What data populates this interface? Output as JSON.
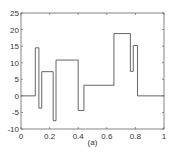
{
  "chart_data": {
    "type": "line",
    "subtype": "step",
    "title": "",
    "caption": "(a)",
    "xlabel": "",
    "ylabel": "",
    "xlim": [
      0,
      1
    ],
    "ylim": [
      -10,
      25
    ],
    "grid": false,
    "legend": null,
    "x_ticks": [
      "0",
      "0.2",
      "0.4",
      "0.6",
      "0.8",
      "1"
    ],
    "y_ticks": [
      "-10",
      "-5",
      "0",
      "5",
      "10",
      "15",
      "20",
      "25"
    ],
    "series": [
      {
        "name": "signal",
        "color": "#555555",
        "segments": [
          {
            "x0": 0.0,
            "x1": 0.1,
            "y": 0
          },
          {
            "x0": 0.1,
            "x1": 0.125,
            "y": 14.5
          },
          {
            "x0": 0.125,
            "x1": 0.145,
            "y": -3.7
          },
          {
            "x0": 0.145,
            "x1": 0.225,
            "y": 7.3
          },
          {
            "x0": 0.225,
            "x1": 0.245,
            "y": -7.5
          },
          {
            "x0": 0.245,
            "x1": 0.4,
            "y": 10.8
          },
          {
            "x0": 0.4,
            "x1": 0.44,
            "y": -4.4
          },
          {
            "x0": 0.44,
            "x1": 0.65,
            "y": 3.2
          },
          {
            "x0": 0.65,
            "x1": 0.765,
            "y": 18.8
          },
          {
            "x0": 0.765,
            "x1": 0.785,
            "y": 7.4
          },
          {
            "x0": 0.785,
            "x1": 0.815,
            "y": 15.2
          },
          {
            "x0": 0.815,
            "x1": 1.0,
            "y": 0
          }
        ]
      }
    ]
  }
}
